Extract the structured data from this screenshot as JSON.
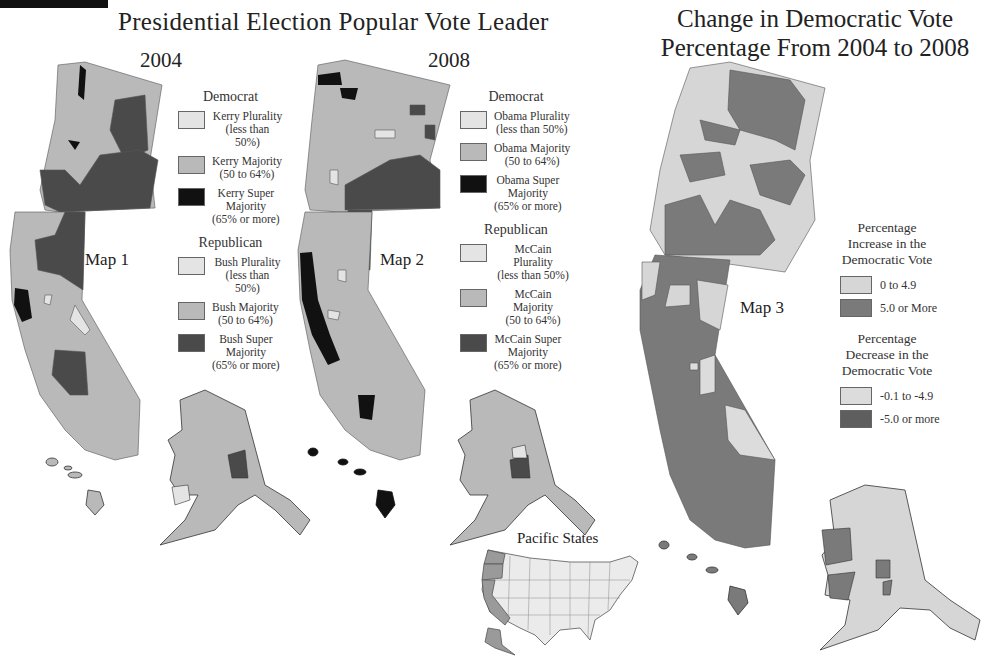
{
  "header": {
    "title": "Presidential Election Popular Vote Leader",
    "change_title_line1": "Change in Democratic Vote",
    "change_title_line2": "Percentage From 2004 to 2008"
  },
  "colors": {
    "plurality": "#e4e4e4",
    "majority": "#b9b9b9",
    "dem_super": "#111111",
    "rep_super": "#4a4a4a",
    "increase_low": "#d6d6d6",
    "increase_high": "#7a7a7a",
    "decrease_low": "#dcdcdc",
    "decrease_high": "#5e5e5e",
    "us_other": "#ebebeb",
    "us_pacific": "#9a9a9a"
  },
  "map1": {
    "year": "2004",
    "label": "Map 1",
    "democrat": {
      "heading": "Democrat",
      "items": [
        {
          "line1": "Kerry Plurality",
          "line2": "(less than 50%)",
          "line3": ""
        },
        {
          "line1": "Kerry Majority",
          "line2": "(50 to 64%)",
          "line3": ""
        },
        {
          "line1": "Kerry Super",
          "line2": "Majority",
          "line3": "(65% or more)"
        }
      ]
    },
    "republican": {
      "heading": "Republican",
      "items": [
        {
          "line1": "Bush Plurality",
          "line2": "(less than 50%)",
          "line3": ""
        },
        {
          "line1": "Bush Majority",
          "line2": "(50 to 64%)",
          "line3": ""
        },
        {
          "line1": "Bush Super",
          "line2": "Majority",
          "line3": "(65% or more)"
        }
      ]
    }
  },
  "map2": {
    "year": "2008",
    "label": "Map 2",
    "democrat": {
      "heading": "Democrat",
      "items": [
        {
          "line1": "Obama Plurality",
          "line2": "(less than 50%)",
          "line3": ""
        },
        {
          "line1": "Obama Majority",
          "line2": "(50 to 64%)",
          "line3": ""
        },
        {
          "line1": "Obama Super",
          "line2": "Majority",
          "line3": "(65% or more)"
        }
      ]
    },
    "republican": {
      "heading": "Republican",
      "items": [
        {
          "line1": "McCain Plurality",
          "line2": "(less than 50%)",
          "line3": ""
        },
        {
          "line1": "McCain Majority",
          "line2": "(50 to 64%)",
          "line3": ""
        },
        {
          "line1": "McCain Super",
          "line2": "Majority",
          "line3": "(65% or more)"
        }
      ]
    }
  },
  "map3": {
    "label": "Map 3",
    "increase": {
      "heading_line1": "Percentage",
      "heading_line2": "Increase in the",
      "heading_line3": "Democratic Vote",
      "items": [
        {
          "label": "0 to 4.9"
        },
        {
          "label": "5.0 or More"
        }
      ]
    },
    "decrease": {
      "heading_line1": "Percentage",
      "heading_line2": "Decrease in the",
      "heading_line3": "Democratic Vote",
      "items": [
        {
          "label": "-0.1 to -4.9"
        },
        {
          "label": "-5.0 or more"
        }
      ]
    }
  },
  "inset": {
    "title": "Pacific States"
  }
}
